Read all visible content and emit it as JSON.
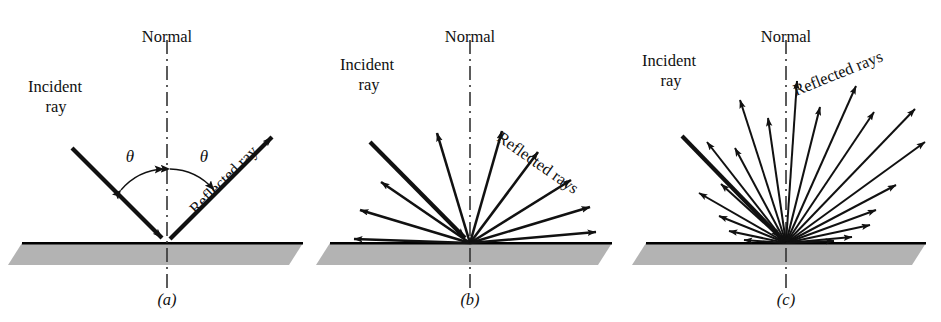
{
  "figure": {
    "background_color": "#ffffff",
    "ink_color": "#111111",
    "surface_fill_color": "#b3b3b3",
    "surface_edge_color": "#000000"
  },
  "panels": [
    {
      "id": "a",
      "caption": "(a)",
      "kind": "specular-reflection",
      "labels": {
        "normal": "Normal",
        "incident_line1": "Incident",
        "incident_line2": "ray",
        "reflected": "Reflected ray",
        "angle_incidence": "θ",
        "angle_reflection": "θ"
      },
      "geometry": {
        "origin_x": 167,
        "origin_y": 243,
        "normal_top_y": 40,
        "normal_bottom_y": 290,
        "incident_angle_deg": 45,
        "reflected_angle_deg": 45
      },
      "rays": {
        "incident": {
          "angle_from_normal_deg": 45,
          "length": 135
        },
        "reflected": [
          {
            "angle_from_normal_deg": 45,
            "length": 150
          }
        ]
      }
    },
    {
      "id": "b",
      "caption": "(b)",
      "kind": "partly-diffuse-reflection",
      "labels": {
        "normal": "Normal",
        "incident_line1": "Incident",
        "incident_line2": "ray",
        "reflected": "Reflected rays"
      },
      "geometry": {
        "origin_x": 158,
        "origin_y": 243,
        "normal_top_y": 40,
        "normal_bottom_y": 290,
        "incident_angle_deg": 45
      },
      "rays": {
        "incident": {
          "angle_from_normal_deg": 45,
          "length": 140
        },
        "reflected_count": 10,
        "reflected": [
          {
            "angle_from_normal_deg": -88,
            "length": 118
          },
          {
            "angle_from_normal_deg": -72,
            "length": 108
          },
          {
            "angle_from_normal_deg": -56,
            "length": 108
          },
          {
            "angle_from_normal_deg": -16,
            "length": 120
          },
          {
            "angle_from_normal_deg": 14,
            "length": 122
          },
          {
            "angle_from_normal_deg": 34,
            "length": 126
          },
          {
            "angle_from_normal_deg": 52,
            "length": 128
          },
          {
            "angle_from_normal_deg": 68,
            "length": 130
          },
          {
            "angle_from_normal_deg": 82,
            "length": 126
          }
        ]
      }
    },
    {
      "id": "c",
      "caption": "(c)",
      "kind": "fully-diffuse-reflection",
      "labels": {
        "normal": "Normal",
        "incident_line1": "Incident",
        "incident_line2": "ray",
        "reflected": "Reflected rays"
      },
      "geometry": {
        "origin_x": 162,
        "origin_y": 243,
        "normal_top_y": 40,
        "normal_bottom_y": 290,
        "incident_angle_deg": 45
      },
      "rays": {
        "incident": {
          "angle_from_normal_deg": 45,
          "length": 148
        },
        "reflected_count": 20,
        "reflected": [
          {
            "angle_from_normal_deg": -86,
            "length": 42
          },
          {
            "angle_from_normal_deg": -78,
            "length": 58
          },
          {
            "angle_from_normal_deg": -68,
            "length": 72
          },
          {
            "angle_from_normal_deg": -60,
            "length": 100
          },
          {
            "angle_from_normal_deg": -48,
            "length": 88
          },
          {
            "angle_from_normal_deg": -38,
            "length": 128
          },
          {
            "angle_from_normal_deg": -28,
            "length": 108
          },
          {
            "angle_from_normal_deg": -18,
            "length": 150
          },
          {
            "angle_from_normal_deg": -8,
            "length": 126
          },
          {
            "angle_from_normal_deg": 4,
            "length": 162
          },
          {
            "angle_from_normal_deg": 14,
            "length": 140
          },
          {
            "angle_from_normal_deg": 24,
            "length": 172
          },
          {
            "angle_from_normal_deg": 34,
            "length": 158
          },
          {
            "angle_from_normal_deg": 44,
            "length": 186
          },
          {
            "angle_from_normal_deg": 54,
            "length": 172
          },
          {
            "angle_from_normal_deg": 62,
            "length": 124
          },
          {
            "angle_from_normal_deg": 70,
            "length": 96
          },
          {
            "angle_from_normal_deg": 78,
            "length": 86
          },
          {
            "angle_from_normal_deg": 85,
            "length": 66
          },
          {
            "angle_from_normal_deg": 89,
            "length": 48
          }
        ]
      }
    }
  ]
}
